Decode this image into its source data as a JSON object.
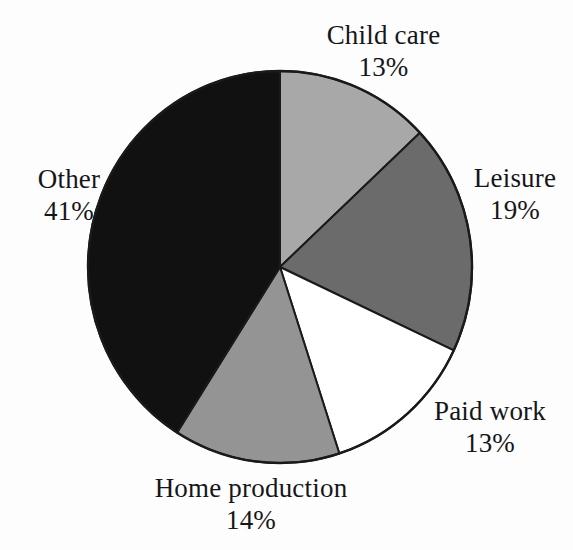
{
  "figure": {
    "background_color": "#fdfdfd",
    "text_color": "#16161a"
  },
  "chart_data": {
    "type": "pie",
    "title": "",
    "subtitle": "",
    "xlabel": "",
    "ylabel": "",
    "legend_position": "none",
    "grid": false,
    "labels_show_percent": true,
    "start_angle_deg": 0,
    "direction": "clockwise",
    "center": {
      "x": 280,
      "y": 267
    },
    "radius": 192,
    "categories": [
      "Child care",
      "Leisure",
      "Paid work",
      "Home production",
      "Other"
    ],
    "values": [
      13,
      19,
      13,
      14,
      41
    ],
    "total": 100,
    "units": "%",
    "slices": [
      {
        "name": "Child care",
        "value": 13,
        "value_text": "13%",
        "color": "#a8a8a8",
        "start_deg": 0,
        "end_deg": 46.8,
        "label_position": "top"
      },
      {
        "name": "Leisure",
        "value": 19,
        "value_text": "19%",
        "color": "#6b6b6b",
        "start_deg": 46.8,
        "end_deg": 115.2,
        "label_position": "right"
      },
      {
        "name": "Paid work",
        "value": 13,
        "value_text": "13%",
        "color": "#ffffff",
        "start_deg": 115.2,
        "end_deg": 162.0,
        "label_position": "bottom-right"
      },
      {
        "name": "Home production",
        "value": 14,
        "value_text": "14%",
        "color": "#949494",
        "start_deg": 162.0,
        "end_deg": 212.4,
        "label_position": "bottom"
      },
      {
        "name": "Other",
        "value": 41,
        "value_text": "41%",
        "color": "#111111",
        "start_deg": 212.4,
        "end_deg": 360.0,
        "label_position": "left"
      }
    ],
    "outline_color": "#1a1a1a",
    "outline_width": 2
  }
}
